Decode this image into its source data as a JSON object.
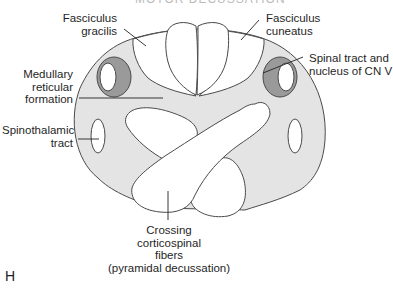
{
  "figure": {
    "title_partial": "MOTOR DECUSSATION",
    "panel_letter": "H",
    "colors": {
      "background_fill": "#e4e4e4",
      "nucleus_fill": "#9a9a9a",
      "tract_fill": "#ffffff",
      "stroke": "#4a4a4a",
      "leader_line": "#222222"
    }
  },
  "labels": {
    "fasciculus_gracilis": [
      "Fasciculus",
      "gracilis"
    ],
    "fasciculus_cuneatus": [
      "Fasciculus",
      "cuneatus"
    ],
    "medullary_reticular_formation": [
      "Medullary",
      "reticular",
      "formation"
    ],
    "spinal_tract_cn_v": [
      "Spinal tract and",
      "nucleus of CN V"
    ],
    "spinothalamic_tract": [
      "Spinothalamic",
      "tract"
    ],
    "crossing_corticospinal": [
      "Crossing",
      "corticospinal",
      "fibers",
      "(pyramidal decussation)"
    ]
  }
}
